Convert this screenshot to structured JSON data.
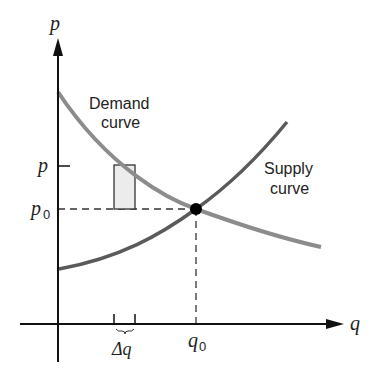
{
  "diagram": {
    "axes": {
      "y_label": "p",
      "x_label": "q"
    },
    "curves": {
      "demand": {
        "label_line1": "Demand",
        "label_line2": "curve",
        "color": "#8c8c8c"
      },
      "supply": {
        "label_line1": "Supply",
        "label_line2": "curve",
        "color": "#5a5a5a"
      }
    },
    "ticks": {
      "p": "p",
      "p0_main": "p",
      "p0_sub": "0",
      "q0_main": "q",
      "q0_sub": "0",
      "delta_q": "Δq"
    },
    "equilibrium_point": {
      "color": "#000000"
    },
    "strip": {
      "fill": "#ececec",
      "stroke": "#333333"
    }
  }
}
